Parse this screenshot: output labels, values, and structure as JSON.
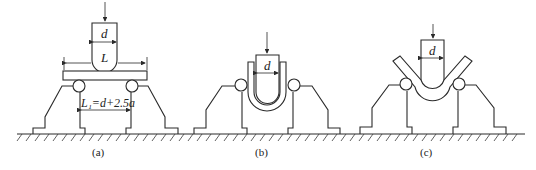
{
  "diagram": {
    "type": "bend-test-fixture",
    "panels": [
      {
        "id": "a",
        "caption": "(a)",
        "punch_label": "d",
        "span_label": "L",
        "gap_label": "L₁=d+2.5a",
        "specimen": "flat plate"
      },
      {
        "id": "b",
        "caption": "(b)",
        "punch_label": "d",
        "specimen": "U-bent"
      },
      {
        "id": "c",
        "caption": "(c)",
        "punch_label": "d",
        "specimen": "V-bent"
      }
    ],
    "colors": {
      "line": "#2a2a2a",
      "background": "#ffffff"
    }
  }
}
